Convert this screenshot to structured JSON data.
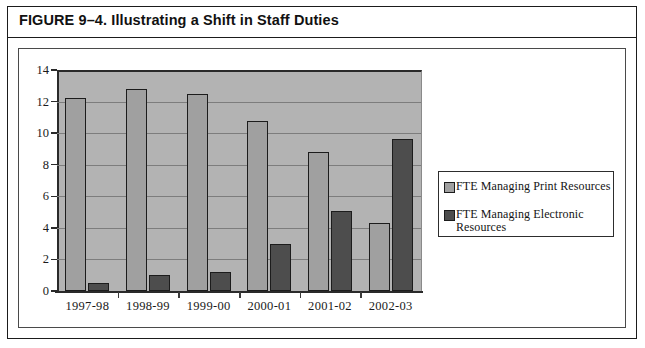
{
  "figure": {
    "title": "FIGURE 9–4. Illustrating a Shift in Staff Duties"
  },
  "chart_data": {
    "type": "bar",
    "title": "",
    "xlabel": "",
    "ylabel": "",
    "categories": [
      "1997-98",
      "1998-99",
      "1999-00",
      "2000-01",
      "2001-02",
      "2002-03"
    ],
    "series": [
      {
        "name": "FTE Managing Print Resources",
        "color": "#a0a0a0",
        "values": [
          12.2,
          12.8,
          12.5,
          10.8,
          8.8,
          4.3
        ]
      },
      {
        "name": "FTE Managing Electronic Resources",
        "color": "#4d4d4d",
        "values": [
          0.5,
          1.0,
          1.2,
          3.0,
          5.1,
          9.6
        ]
      }
    ],
    "ylim": [
      0,
      14
    ],
    "yticks": [
      0,
      2,
      4,
      6,
      8,
      10,
      12,
      14
    ],
    "ytick_labels": [
      "0",
      "2",
      "4",
      "6",
      "8",
      "10",
      "12",
      "14"
    ],
    "grid": true,
    "legend_position": "right",
    "plot_background": "#b3b3b3"
  },
  "legend": {
    "entries": [
      {
        "label": "FTE Managing Print Resources",
        "swatch": "print"
      },
      {
        "label": "FTE Managing Electronic Resources",
        "swatch": "electronic"
      }
    ]
  }
}
